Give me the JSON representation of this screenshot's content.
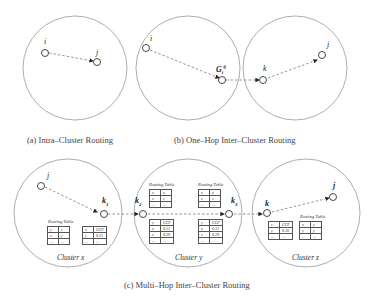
{
  "captions": {
    "a": "(a) Intra–Cluster Routing",
    "b": "(b) One–Hop Inter–Cluster Routing",
    "c": "(c) Multi–Hop Inter–Cluster Routing"
  },
  "nodes": {
    "a_i": "i",
    "a_j": "j",
    "b_i": "i",
    "b_g": "G",
    "b_g_sub": "i",
    "b_g_sup": "ij",
    "b_k": "k",
    "b_j": "j",
    "c_j_src": "j",
    "c_k1": "k",
    "c_k1_sub": "1",
    "c_k2": "k",
    "c_k2_sub": "2",
    "c_k3": "k",
    "c_k3_sub": "3",
    "c_k": "k",
    "c_j": "j"
  },
  "clusters": {
    "x": "Cluster x",
    "y": "Cluster y",
    "z": "Cluster z"
  },
  "tables": {
    "routing_title": "Routing Table",
    "x_routing": [
      [
        "y",
        "y"
      ],
      [
        "z",
        "y"
      ],
      [
        "...",
        "..."
      ]
    ],
    "x_ccp": [
      [
        "x",
        "CCP"
      ],
      [
        "y",
        "0.21"
      ],
      [
        "...",
        "..."
      ]
    ],
    "y1_routing": [
      [
        "x",
        "x"
      ],
      [
        "z",
        "z"
      ],
      [
        "...",
        "..."
      ]
    ],
    "y1_ccp": [
      [
        "y",
        "CCP"
      ],
      [
        "x",
        "0.12"
      ],
      [
        "z",
        "0.20"
      ],
      [
        "...",
        "..."
      ]
    ],
    "y2_routing": [
      [
        "x",
        "x"
      ],
      [
        "z",
        "z"
      ],
      [
        "...",
        "..."
      ]
    ],
    "y2_ccp": [
      [
        "y",
        "CCP"
      ],
      [
        "x",
        "0.12"
      ],
      [
        "z",
        "0.20"
      ],
      [
        "...",
        "..."
      ]
    ],
    "z_ccp": [
      [
        "z",
        "CCP"
      ],
      [
        "y",
        "0.16"
      ],
      [
        "...",
        "..."
      ]
    ],
    "z_routing": [
      [
        "x",
        "y"
      ],
      [
        "y",
        "y"
      ],
      [
        "...",
        "..."
      ]
    ]
  }
}
